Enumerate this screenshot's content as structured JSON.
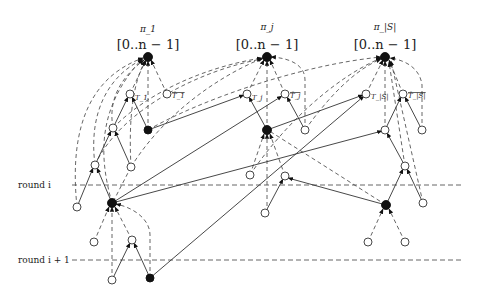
{
  "figure": {
    "type": "tree-connection-diagram",
    "columns": [
      {
        "process": "π_1",
        "interval": "[0..n − 1]",
        "left_label": "T_1",
        "right_label": "T̄_1"
      },
      {
        "process": "π_j",
        "interval": "[0..n − 1]",
        "left_label": "T_j",
        "right_label": "T̄_j"
      },
      {
        "process": "π_|S|",
        "interval": "[0..n − 1]",
        "left_label": "T_|S|",
        "right_label": "T̄_|S|"
      }
    ],
    "rounds": [
      {
        "label": "round i"
      },
      {
        "label": "round i + 1"
      }
    ],
    "legend_colors": {
      "filled_node": "#111111",
      "open_node": "#ffffff",
      "line": "#333333"
    }
  }
}
